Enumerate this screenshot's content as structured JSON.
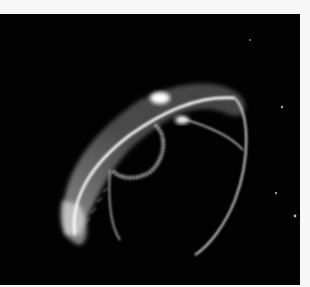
{
  "image": {
    "subject": "Translucent jellyfish on black background",
    "background_color": "#020202",
    "border_color": "#f7f7f7",
    "glow_color": "#e8e8e8"
  }
}
